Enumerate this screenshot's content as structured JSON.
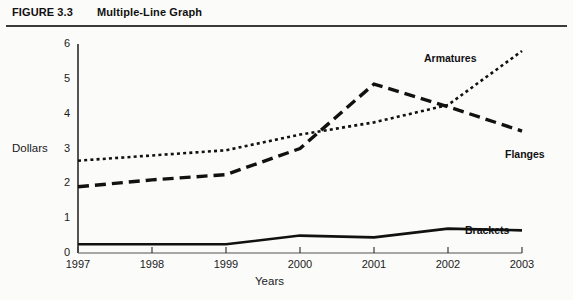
{
  "figure": {
    "number": "FIGURE 3.3",
    "title": "Multiple-Line Graph"
  },
  "chart_data": {
    "type": "line",
    "title": "Multiple-Line Graph",
    "xlabel": "Years",
    "ylabel": "Dollars",
    "categories": [
      "1997",
      "1998",
      "1999",
      "2000",
      "2001",
      "2002",
      "2003"
    ],
    "x_tick_labels": [
      "1997",
      "1998",
      "1999",
      "2000",
      "2001",
      "2002",
      "2003"
    ],
    "y_tick_labels": [
      "0",
      "1",
      "2",
      "3",
      "4",
      "5",
      "6"
    ],
    "ylim": [
      0,
      6
    ],
    "grid": false,
    "legend": "inline-labels-at-right",
    "series": [
      {
        "name": "Armatures",
        "style": "dotted",
        "color": "#111111",
        "values": [
          2.65,
          2.8,
          2.95,
          3.4,
          3.75,
          4.25,
          5.8
        ]
      },
      {
        "name": "Flanges",
        "style": "dashed",
        "color": "#111111",
        "values": [
          1.9,
          2.1,
          2.25,
          3.0,
          4.85,
          4.2,
          3.5
        ]
      },
      {
        "name": "Brackets",
        "style": "solid",
        "color": "#111111",
        "values": [
          0.25,
          0.25,
          0.25,
          0.5,
          0.45,
          0.7,
          0.65
        ]
      }
    ]
  }
}
